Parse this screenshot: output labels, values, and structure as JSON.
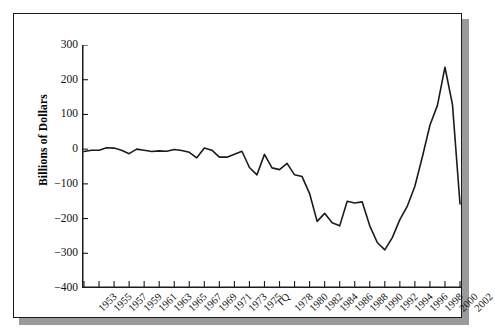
{
  "figure": {
    "background_color": "#ffffff",
    "frame_color": "#1b1b1b",
    "shadow_color": "#9a9a9a",
    "line_color": "#1b1b1b",
    "axis_color": "#1b1b1b"
  },
  "chart_data": {
    "type": "line",
    "title": "",
    "xlabel": "",
    "ylabel": "Billions of Dollars",
    "ylim": [
      -400,
      300
    ],
    "yticks": [
      300,
      200,
      100,
      0,
      -100,
      -200,
      -300,
      -400
    ],
    "ytick_labels": [
      "300",
      "200",
      "100",
      "0",
      "−100",
      "−200",
      "−300",
      "−400"
    ],
    "grid": false,
    "legend": "none",
    "categories": [
      "1953",
      "1954",
      "1955",
      "1956",
      "1957",
      "1958",
      "1959",
      "1960",
      "1961",
      "1962",
      "1963",
      "1964",
      "1965",
      "1966",
      "1967",
      "1968",
      "1969",
      "1970",
      "1971",
      "1972",
      "1973",
      "1974",
      "1975",
      "1976",
      "TQ",
      "1977",
      "1978",
      "1979",
      "1980",
      "1981",
      "1982",
      "1983",
      "1984",
      "1985",
      "1986",
      "1987",
      "1988",
      "1989",
      "1990",
      "1991",
      "1992",
      "1993",
      "1994",
      "1995",
      "1996",
      "1997",
      "1998",
      "1999",
      "2000",
      "2001",
      "2002"
    ],
    "xtick_labels": [
      "1953",
      "1955",
      "1957",
      "1959",
      "1961",
      "1963",
      "1965",
      "1967",
      "1969",
      "1971",
      "1973",
      "1975",
      "TQ",
      "1978",
      "1980",
      "1982",
      "1984",
      "1986",
      "1988",
      "1990",
      "1992",
      "1994",
      "1996",
      "1998",
      "2000",
      "2002"
    ],
    "xtick_indices": [
      0,
      2,
      4,
      6,
      8,
      10,
      12,
      14,
      16,
      18,
      20,
      22,
      24,
      26,
      28,
      30,
      32,
      34,
      36,
      38,
      40,
      42,
      44,
      46,
      48,
      50
    ],
    "values": [
      -7,
      -3,
      -3,
      4,
      3,
      -3,
      -13,
      0,
      -3,
      -7,
      -5,
      -6,
      -1,
      -4,
      -9,
      -25,
      3,
      -3,
      -23,
      -23,
      -15,
      -6,
      -53,
      -74,
      -15,
      -54,
      -59,
      -41,
      -74,
      -79,
      -128,
      -208,
      -185,
      -212,
      -221,
      -150,
      -155,
      -152,
      -221,
      -269,
      -290,
      -255,
      -203,
      -164,
      -107,
      -22,
      69,
      126,
      236,
      128,
      -158
    ],
    "series_name": "Federal budget surplus/deficit"
  }
}
